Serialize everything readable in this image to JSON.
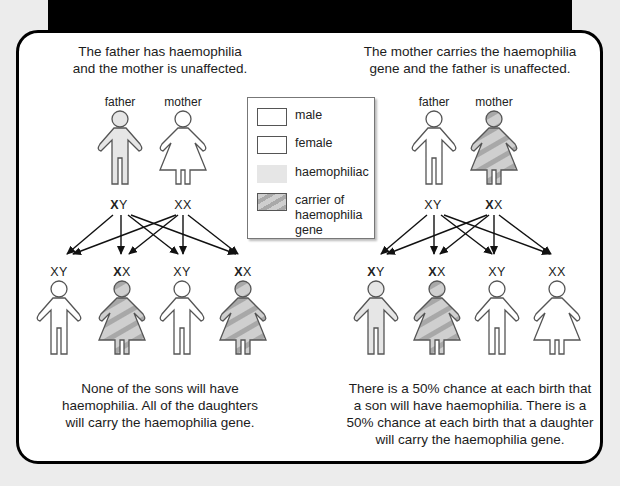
{
  "left_panel": {
    "title_line1": "The father has haemophilia",
    "title_line2": "and the mother is unaffected.",
    "parents": [
      {
        "label": "father",
        "genotype_bold": "X",
        "genotype_rest": "Y",
        "status": "haemophiliac"
      },
      {
        "label": "mother",
        "genotype_bold": "",
        "genotype_rest": "XX",
        "status": "unaffected"
      }
    ],
    "children": [
      {
        "genotype_bold": "",
        "genotype_rest": "XY",
        "sex": "male",
        "status": "unaffected"
      },
      {
        "genotype_bold": "X",
        "genotype_rest": "X",
        "sex": "female",
        "status": "carrier"
      },
      {
        "genotype_bold": "",
        "genotype_rest": "XY",
        "sex": "male",
        "status": "unaffected"
      },
      {
        "genotype_bold": "X",
        "genotype_rest": "X",
        "sex": "female",
        "status": "carrier"
      }
    ],
    "conclusion_line1": "None of the sons will have",
    "conclusion_line2": "haemophilia. All of the daughters",
    "conclusion_line3": "will carry the haemophilia gene."
  },
  "right_panel": {
    "title_line1": "The mother carries the haemophilia",
    "title_line2": "gene and the father is unaffected.",
    "parents": [
      {
        "label": "father",
        "genotype_bold": "",
        "genotype_rest": "XY",
        "status": "unaffected"
      },
      {
        "label": "mother",
        "genotype_bold": "X",
        "genotype_rest": "X",
        "status": "carrier"
      }
    ],
    "children": [
      {
        "genotype_bold": "X",
        "genotype_rest": "Y",
        "sex": "male",
        "status": "haemophiliac"
      },
      {
        "genotype_bold": "X",
        "genotype_rest": "X",
        "sex": "female",
        "status": "carrier"
      },
      {
        "genotype_bold": "",
        "genotype_rest": "XY",
        "sex": "male",
        "status": "unaffected"
      },
      {
        "genotype_bold": "",
        "genotype_rest": "XX",
        "sex": "female",
        "status": "unaffected"
      }
    ],
    "conclusion_line1": "There is a 50% chance at each birth that",
    "conclusion_line2": "a son will have haemophilia. There is a",
    "conclusion_line3": "50% chance at each birth that a daughter",
    "conclusion_line4": "will carry the haemophilia gene."
  },
  "legend": {
    "items": [
      {
        "label": "male",
        "swatch": "outline"
      },
      {
        "label": "female",
        "swatch": "outline"
      },
      {
        "label": "haemophiliac",
        "swatch": "light-grey"
      },
      {
        "label_line1": "carrier of",
        "label_line2": "haemophilia",
        "label_line3": "gene",
        "swatch": "striped"
      }
    ]
  },
  "colors": {
    "haemophiliac_fill": "#e6e6e6",
    "carrier_stripe_light": "#cfcfcf",
    "carrier_stripe_dark": "#a9a9a9",
    "outline": "#555555",
    "card_border": "#000000",
    "background": "#ececec"
  }
}
